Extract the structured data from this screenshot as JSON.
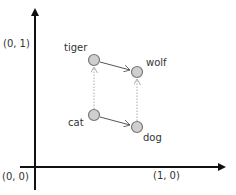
{
  "axes": {
    "y_label": "(0, 1)",
    "origin_label": "(0, 0)",
    "x_label": "(1, 0)"
  },
  "nodes": [
    {
      "id": "tiger",
      "label": "tiger",
      "cx": 94,
      "cy": 60
    },
    {
      "id": "wolf",
      "label": "wolf",
      "cx": 137,
      "cy": 72
    },
    {
      "id": "cat",
      "label": "cat",
      "cx": 94,
      "cy": 115
    },
    {
      "id": "dog",
      "label": "dog",
      "cx": 137,
      "cy": 127
    }
  ],
  "edges": [
    {
      "from": "tiger",
      "to": "wolf",
      "style": "solid"
    },
    {
      "from": "cat",
      "to": "dog",
      "style": "solid"
    },
    {
      "from": "cat",
      "to": "tiger",
      "style": "dotted"
    },
    {
      "from": "dog",
      "to": "wolf",
      "style": "dotted"
    }
  ],
  "colors": {
    "axis": "#111111",
    "node_fill": "#cfcfcf",
    "node_stroke": "#777777",
    "solid_edge": "#555555",
    "dotted_edge": "#aaaaaa"
  }
}
